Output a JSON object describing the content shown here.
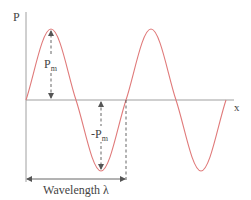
{
  "diagram": {
    "type": "sine-wave",
    "y_axis_label": "P",
    "x_axis_label": "x",
    "amplitude_label": {
      "base": "P",
      "sub": "m"
    },
    "neg_amplitude_label": {
      "base": "-P",
      "sub": "m"
    },
    "wavelength_label": "Wavelength λ",
    "colors": {
      "wave": "#e07a7a",
      "axis": "#a0a0a0",
      "annotation": "#555555",
      "text": "#444444"
    },
    "cycles_shown": 2
  }
}
